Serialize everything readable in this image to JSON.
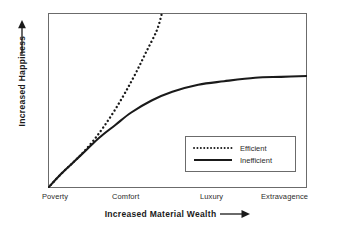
{
  "chart_data": {
    "type": "line",
    "title": "",
    "xlabel": "Increased Material Wealth",
    "ylabel": "Increased Happiness",
    "xlabel_arrow": "arrow-right",
    "ylabel_arrow": "arrow-up",
    "categories": [
      "Poverty",
      "Comfort",
      "Luxury",
      "Extravagence"
    ],
    "x_tick_positions_pct": [
      0,
      30,
      63,
      97
    ],
    "xlim": [
      0,
      100
    ],
    "ylim": [
      0,
      100
    ],
    "grid": false,
    "frame": true,
    "legend_position": "inside-lower-right",
    "line_color": "#1a1a1a",
    "frame_color": "#6b6b6b",
    "background_color": "#ffffff",
    "series": [
      {
        "name": "Efficient",
        "style": "dotted",
        "points": [
          {
            "x": 0,
            "y": 0
          },
          {
            "x": 5,
            "y": 8
          },
          {
            "x": 10,
            "y": 15
          },
          {
            "x": 14,
            "y": 21
          },
          {
            "x": 18,
            "y": 28
          },
          {
            "x": 22,
            "y": 36
          },
          {
            "x": 26,
            "y": 45
          },
          {
            "x": 30,
            "y": 55
          },
          {
            "x": 34,
            "y": 66
          },
          {
            "x": 38,
            "y": 78
          },
          {
            "x": 42,
            "y": 90
          },
          {
            "x": 44,
            "y": 100
          }
        ]
      },
      {
        "name": "Inefficient",
        "style": "solid",
        "points": [
          {
            "x": 0,
            "y": 0
          },
          {
            "x": 5,
            "y": 8
          },
          {
            "x": 10,
            "y": 15
          },
          {
            "x": 15,
            "y": 22
          },
          {
            "x": 20,
            "y": 29
          },
          {
            "x": 26,
            "y": 36
          },
          {
            "x": 32,
            "y": 43
          },
          {
            "x": 40,
            "y": 50
          },
          {
            "x": 48,
            "y": 55
          },
          {
            "x": 58,
            "y": 59
          },
          {
            "x": 68,
            "y": 61
          },
          {
            "x": 80,
            "y": 63
          },
          {
            "x": 90,
            "y": 63.5
          },
          {
            "x": 100,
            "y": 64
          }
        ]
      }
    ],
    "legend": [
      {
        "label": "Efficient",
        "style": "dotted"
      },
      {
        "label": "Inefficient",
        "style": "solid"
      }
    ]
  }
}
